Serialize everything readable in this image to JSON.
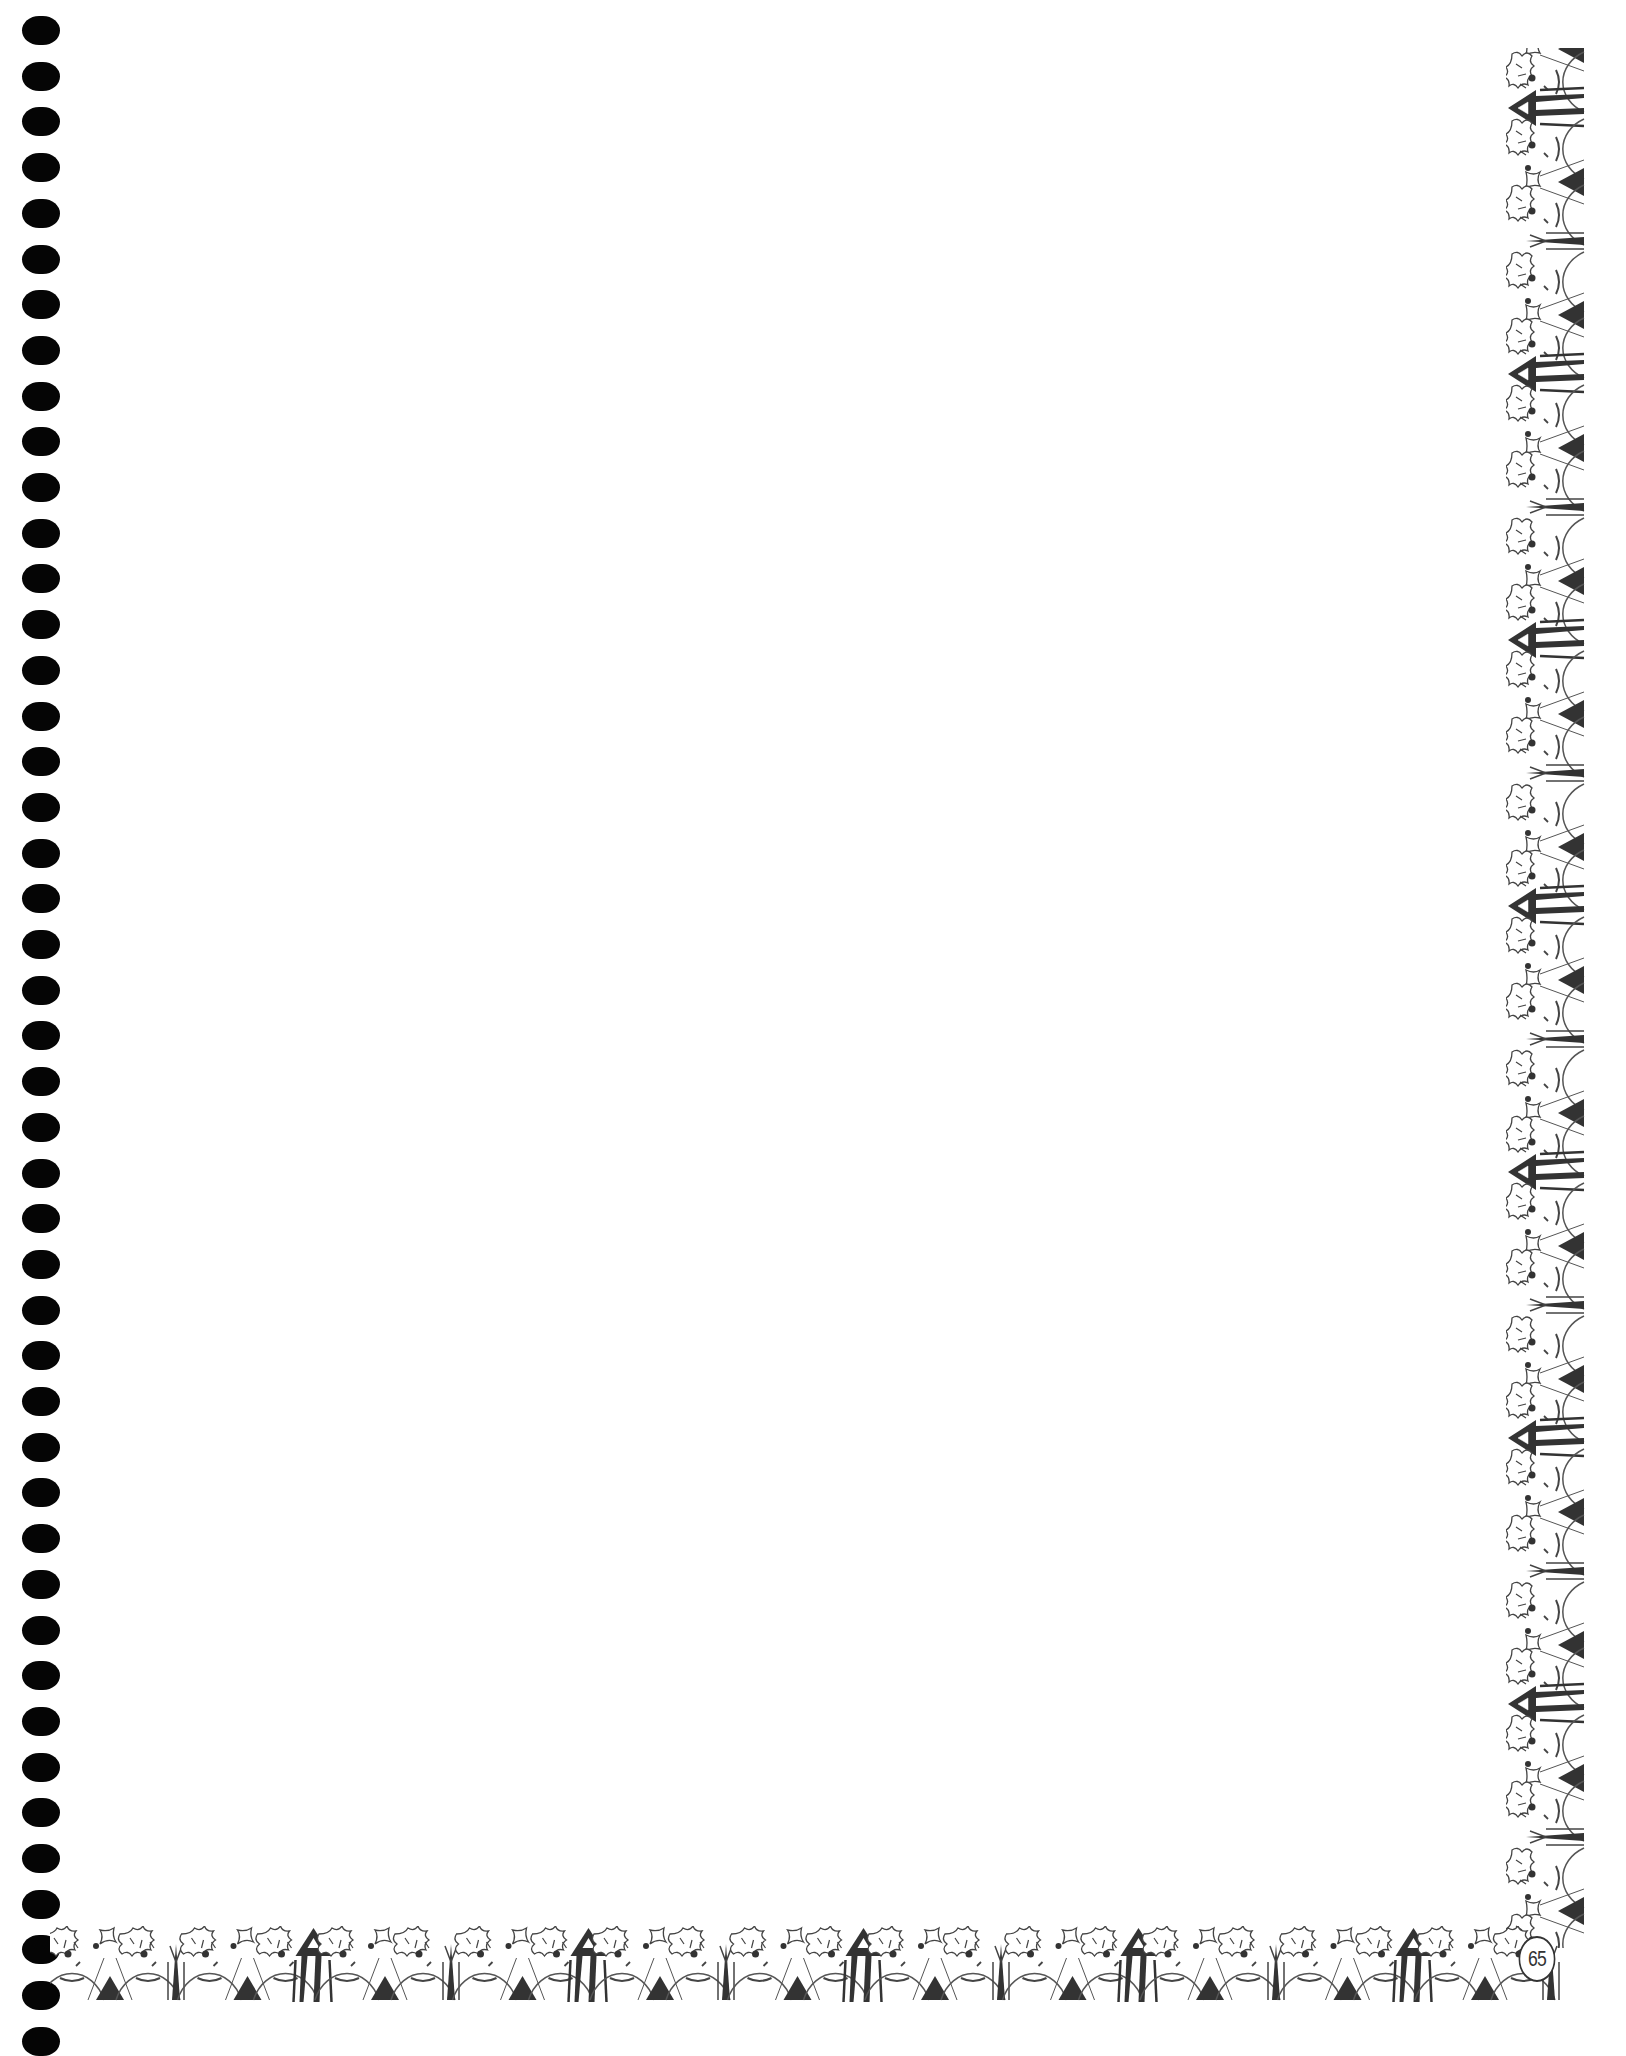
{
  "page": {
    "type": "blank decorative notebook page",
    "page_number": "65",
    "background_color": "#ffffff",
    "ink_color": "#333333"
  },
  "binding": {
    "style": "spiral binding holes",
    "hole_count": 45,
    "hole_color": "#050505"
  },
  "border": {
    "motif": [
      "face-with-leafy-hair",
      "triangle",
      "tree",
      "pencil"
    ],
    "right_edge": {
      "orientation": "vertical",
      "pencil_direction": "left"
    },
    "bottom_edge": {
      "orientation": "horizontal",
      "pencil_direction": "up"
    }
  },
  "content": {
    "text": ""
  }
}
